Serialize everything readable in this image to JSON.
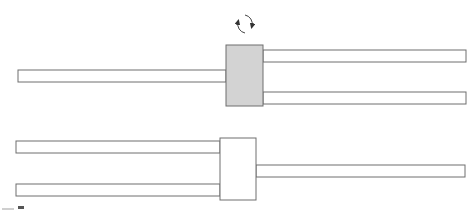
{
  "diagram": {
    "title": "",
    "colors": {
      "stroke": "#6e6e6e",
      "bar_fill": "#ffffff",
      "rotating_block_fill": "#d3d3d3",
      "static_block_fill": "#ffffff"
    },
    "top_assembly": {
      "state": "rotating",
      "rotation_icon": "circular-arrows-icon",
      "block": {
        "x": 226,
        "y": 45,
        "w": 37,
        "h": 61
      },
      "left_bar": {
        "x": 18,
        "y": 70,
        "w": 208,
        "h": 12
      },
      "right_bars": [
        {
          "x": 263,
          "y": 50,
          "w": 203,
          "h": 12
        },
        {
          "x": 263,
          "y": 92,
          "w": 203,
          "h": 12
        }
      ]
    },
    "bottom_assembly": {
      "state": "static",
      "block": {
        "x": 220,
        "y": 138,
        "w": 36,
        "h": 62
      },
      "left_bars": [
        {
          "x": 16,
          "y": 141,
          "w": 204,
          "h": 12
        },
        {
          "x": 16,
          "y": 184,
          "w": 204,
          "h": 12
        }
      ],
      "right_bar": {
        "x": 256,
        "y": 165,
        "w": 209,
        "h": 12
      }
    },
    "rotation_symbol": {
      "cx": 245,
      "cy": 24,
      "r": 9
    }
  }
}
